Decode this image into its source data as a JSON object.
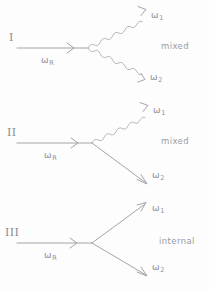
{
  "figure": {
    "background_color": "#fdfdfe",
    "ink_color": "#9a9aa2",
    "style": "hand-drawn feynman-style scattering diagrams"
  },
  "diagrams": [
    {
      "numeral": "I",
      "incoming_label": "ω",
      "incoming_sub": "R",
      "out_upper_label": "ω",
      "out_upper_sub": "1",
      "out_lower_label": "ω",
      "out_lower_sub": "2",
      "caption": "mixed",
      "upper_line_style": "wavy",
      "lower_line_style": "wavy"
    },
    {
      "numeral": "II",
      "incoming_label": "ω",
      "incoming_sub": "R",
      "out_upper_label": "ω",
      "out_upper_sub": "1",
      "out_lower_label": "ω",
      "out_lower_sub": "2",
      "caption": "mixed",
      "upper_line_style": "wavy",
      "lower_line_style": "straight"
    },
    {
      "numeral": "III",
      "incoming_label": "ω",
      "incoming_sub": "R",
      "out_upper_label": "ω",
      "out_upper_sub": "1",
      "out_lower_label": "ω",
      "out_lower_sub": "2",
      "caption": "internal",
      "upper_line_style": "straight",
      "lower_line_style": "straight"
    }
  ]
}
